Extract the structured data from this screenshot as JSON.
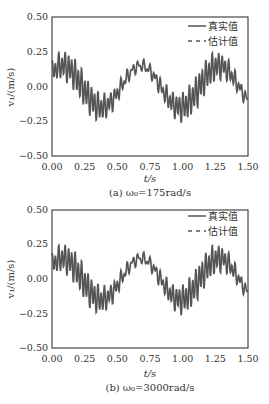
{
  "chart_data": [
    {
      "type": "line",
      "title": "",
      "caption": "(a) ω₀=175rad/s",
      "caption_prefix": "(a) ",
      "caption_omega": "ω",
      "caption_sub": "0",
      "caption_value": "=175rad/s",
      "xlabel": "t/s",
      "ylabel": "v₁/(m/s)",
      "xlim": [
        0,
        1.5
      ],
      "ylim": [
        -0.5,
        0.5
      ],
      "xticks": [
        "0.00",
        "0.25",
        "0.50",
        "0.75",
        "1.00",
        "1.25",
        "1.50"
      ],
      "yticks": [
        "0.50",
        "0.25",
        "0.00",
        "−0.25",
        "−0.50"
      ],
      "legend": {
        "position": "upper right",
        "entries": [
          "真实值",
          "估计值"
        ]
      },
      "grid": false,
      "series": [
        {
          "name": "真实值",
          "style": "solid"
        },
        {
          "name": "估计值",
          "style": "dashed"
        }
      ],
      "signal_model": {
        "base_amplitude": 0.15,
        "base_period_s": 0.6,
        "ripple_amplitude": 0.1,
        "ripple_freq_hz": 40
      },
      "key_points": [
        {
          "t": 0.08,
          "v": 0.28
        },
        {
          "t": 0.38,
          "v": -0.28
        },
        {
          "t": 0.62,
          "v": 0.27
        },
        {
          "t": 0.92,
          "v": -0.28
        },
        {
          "t": 1.22,
          "v": 0.26
        },
        {
          "t": 1.5,
          "v": 0.0
        }
      ]
    },
    {
      "type": "line",
      "title": "",
      "caption": "(b) ω₀=3000rad/s",
      "caption_prefix": "(b) ",
      "caption_omega": "ω",
      "caption_sub": "0",
      "caption_value": "=3000rad/s",
      "xlabel": "t/s",
      "ylabel": "v₁/(m/s)",
      "xlim": [
        0,
        1.5
      ],
      "ylim": [
        -0.5,
        0.5
      ],
      "xticks": [
        "0.00",
        "0.25",
        "0.50",
        "0.75",
        "1.00",
        "1.25",
        "1.50"
      ],
      "yticks": [
        "0.50",
        "0.25",
        "0.00",
        "−0.25",
        "−0.50"
      ],
      "legend": {
        "position": "upper right",
        "entries": [
          "真实值",
          "估计值"
        ]
      },
      "grid": false,
      "series": [
        {
          "name": "真实值",
          "style": "solid"
        },
        {
          "name": "估计值",
          "style": "dashed"
        }
      ],
      "signal_model": {
        "base_amplitude": 0.15,
        "base_period_s": 0.6,
        "ripple_amplitude": 0.1,
        "ripple_freq_hz": 40
      },
      "key_points": [
        {
          "t": 0.08,
          "v": 0.28
        },
        {
          "t": 0.38,
          "v": -0.28
        },
        {
          "t": 0.62,
          "v": 0.27
        },
        {
          "t": 0.92,
          "v": -0.28
        },
        {
          "t": 1.22,
          "v": 0.26
        },
        {
          "t": 1.5,
          "v": 0.0
        }
      ]
    }
  ],
  "colors": {
    "line": "#555555",
    "axis": "#222222",
    "text": "#333333"
  }
}
